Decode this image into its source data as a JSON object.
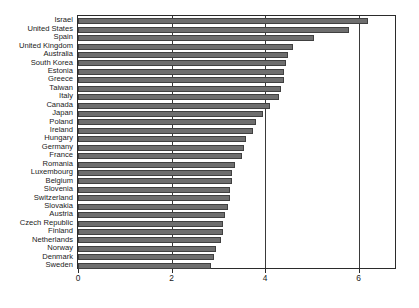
{
  "chart_data": {
    "type": "bar",
    "orientation": "horizontal",
    "title": "",
    "subtitle": "",
    "xlabel": "",
    "ylabel": "",
    "xlim": [
      0,
      6.8
    ],
    "ylim": null,
    "grid": true,
    "grid_axis": "x",
    "legend": null,
    "legend_position": "none",
    "xticks": [
      0,
      2,
      4,
      6
    ],
    "xtick_labels": [
      "0",
      "2",
      "4",
      "6"
    ],
    "bar_color": "#6e6e6e",
    "bar_edge_color": "#404040",
    "frame_color": "#2b2b2b",
    "categories": [
      "Israel",
      "United States",
      "Spain",
      "United Kingdom",
      "Australia",
      "South Korea",
      "Estonia",
      "Greece",
      "Taiwan",
      "Italy",
      "Canada",
      "Japan",
      "Poland",
      "Ireland",
      "Hungary",
      "Germany",
      "France",
      "Romania",
      "Luxembourg",
      "Belgium",
      "Slovenia",
      "Switzerland",
      "Slovakia",
      "Austria",
      "Czech Republic",
      "Finland",
      "Netherlands",
      "Norway",
      "Denmark",
      "Sweden"
    ],
    "values": [
      6.2,
      5.8,
      5.05,
      4.6,
      4.5,
      4.45,
      4.4,
      4.4,
      4.35,
      4.3,
      4.1,
      3.95,
      3.8,
      3.75,
      3.6,
      3.55,
      3.5,
      3.35,
      3.3,
      3.3,
      3.25,
      3.25,
      3.2,
      3.15,
      3.1,
      3.1,
      3.05,
      2.95,
      2.9,
      2.85
    ]
  },
  "axis": {
    "x_tick_0": "0",
    "x_tick_2": "2",
    "x_tick_4": "4",
    "x_tick_6": "6"
  }
}
